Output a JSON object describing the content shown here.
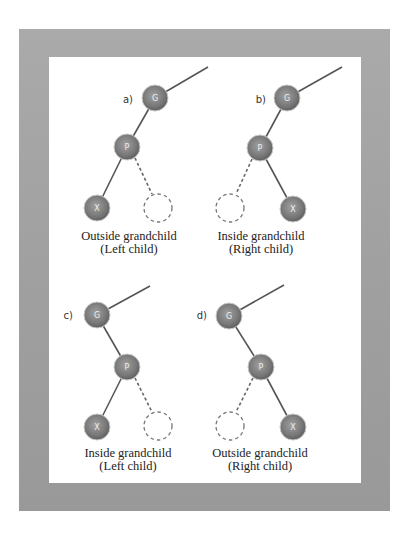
{
  "figure": {
    "type": "red-black tree grandchild configurations",
    "panels": [
      {
        "id": "a",
        "label": "a)",
        "nodes": {
          "grandparent": "G",
          "parent": "P",
          "child": "X"
        },
        "parent_side": "left",
        "child_side": "left",
        "caption_line1": "Outside grandchild",
        "caption_line2": "(Left child)"
      },
      {
        "id": "b",
        "label": "b)",
        "nodes": {
          "grandparent": "G",
          "parent": "P",
          "child": "X"
        },
        "parent_side": "left",
        "child_side": "right",
        "caption_line1": "Inside grandchild",
        "caption_line2": "(Right child)"
      },
      {
        "id": "c",
        "label": "c)",
        "nodes": {
          "grandparent": "G",
          "parent": "P",
          "child": "X"
        },
        "parent_side": "right",
        "child_side": "left",
        "caption_line1": "Inside grandchild",
        "caption_line2": "(Left child)"
      },
      {
        "id": "d",
        "label": "d)",
        "nodes": {
          "grandparent": "G",
          "parent": "P",
          "child": "X"
        },
        "parent_side": "right",
        "child_side": "right",
        "caption_line1": "Outside grandchild",
        "caption_line2": "(Right child)"
      }
    ],
    "colors": {
      "frame": "#a2a2a2",
      "canvas": "#ffffff",
      "node_light": "#9c9c9c",
      "node_dark": "#5b5b5b",
      "edge": "#555555"
    }
  }
}
